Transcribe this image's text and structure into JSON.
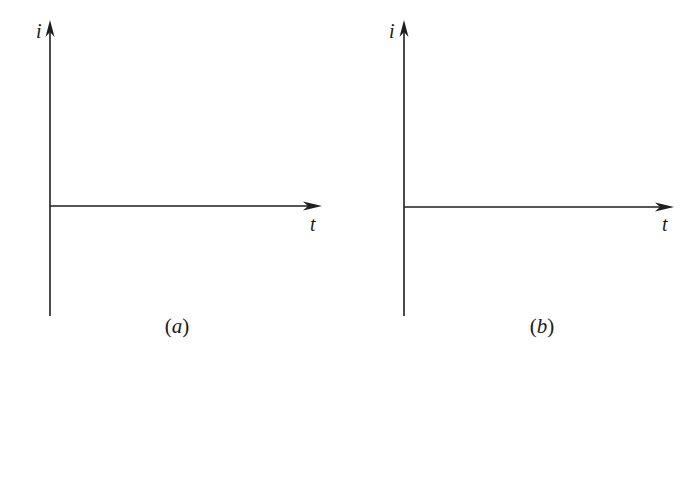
{
  "figure": {
    "panels": [
      {
        "id": "a",
        "caption": "(a)",
        "caption_open": "(",
        "caption_letter": "a",
        "caption_close": ")",
        "y_axis_label": "i",
        "x_axis_label": "t",
        "y_axis": {
          "x": 50,
          "top": 22,
          "bottom": 316
        },
        "x_axis": {
          "y": 206,
          "left": 50,
          "right": 320
        }
      },
      {
        "id": "b",
        "caption": "(b)",
        "caption_open": "(",
        "caption_letter": "b",
        "caption_close": ")",
        "y_axis_label": "i",
        "x_axis_label": "t",
        "y_axis": {
          "x": 404,
          "top": 22,
          "bottom": 316
        },
        "x_axis": {
          "y": 207,
          "left": 404,
          "right": 672
        }
      }
    ],
    "colors": {
      "line": "#1e1e1e",
      "text": "#1a1a1a",
      "background": "#ffffff"
    }
  }
}
